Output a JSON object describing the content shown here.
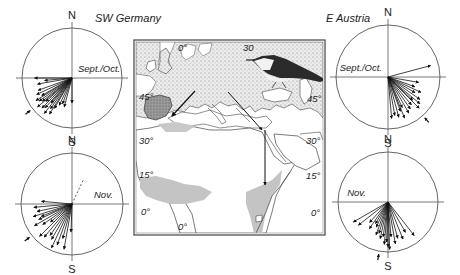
{
  "figure": {
    "regions": {
      "left": "SW Germany",
      "right": "E Austria"
    },
    "compass": {
      "north": "N",
      "south": "S"
    },
    "panels": [
      {
        "id": "sw-germany-septoct",
        "region": "SW Germany",
        "period": "Sept./Oct.",
        "cx": 72,
        "cy": 78,
        "r": 50,
        "mean_direction_deg": 232,
        "vectors_deg": [
          270,
          265,
          260,
          250,
          245,
          240,
          238,
          235,
          232,
          230,
          228,
          225,
          222,
          220,
          218,
          215,
          212,
          210,
          205,
          200,
          195,
          180
        ],
        "vectors_len": [
          0.75,
          0.55,
          0.7,
          0.72,
          0.78,
          0.7,
          0.85,
          0.8,
          0.75,
          0.9,
          0.7,
          0.85,
          0.8,
          0.65,
          0.9,
          0.75,
          0.85,
          0.7,
          0.6,
          0.55,
          0.6,
          0.5
        ]
      },
      {
        "id": "sw-germany-nov",
        "region": "SW Germany",
        "period": "Nov.",
        "cx": 72,
        "cy": 204,
        "r": 51,
        "mean_direction_deg": 232,
        "outlier_deg": 25,
        "vectors_deg": [
          275,
          265,
          258,
          252,
          248,
          245,
          240,
          235,
          230,
          225,
          220,
          215,
          210,
          205,
          200,
          195,
          190,
          182
        ],
        "vectors_len": [
          0.6,
          0.75,
          0.7,
          0.8,
          0.65,
          0.72,
          0.85,
          0.7,
          0.55,
          0.9,
          0.85,
          0.75,
          0.8,
          0.95,
          0.85,
          0.7,
          0.9,
          0.55
        ]
      },
      {
        "id": "e-austria-septoct",
        "region": "E Austria",
        "period": "Sept./Oct.",
        "cx": 388,
        "cy": 77,
        "r": 52,
        "mean_direction_deg": 138,
        "vectors_deg": [
          75,
          100,
          110,
          115,
          120,
          125,
          130,
          133,
          135,
          140,
          145,
          150,
          155,
          158,
          160,
          165,
          170,
          175
        ],
        "vectors_len": [
          0.85,
          0.6,
          0.55,
          0.7,
          0.6,
          0.75,
          0.8,
          0.65,
          0.85,
          0.7,
          0.75,
          0.8,
          0.65,
          0.85,
          0.7,
          0.8,
          0.75,
          0.8
        ]
      },
      {
        "id": "e-austria-nov",
        "region": "E Austria",
        "period": "Nov.",
        "cx": 388,
        "cy": 202,
        "r": 50,
        "mean_direction_deg": 190,
        "vectors_deg": [
          142,
          150,
          158,
          165,
          170,
          175,
          178,
          180,
          182,
          185,
          188,
          192,
          196,
          200,
          205,
          210,
          215,
          222,
          232,
          240
        ],
        "vectors_len": [
          0.85,
          0.7,
          0.8,
          0.75,
          0.85,
          0.7,
          0.95,
          0.9,
          0.8,
          0.85,
          0.7,
          0.75,
          0.65,
          0.7,
          0.55,
          0.5,
          0.65,
          0.55,
          0.75,
          0.8
        ]
      }
    ],
    "map": {
      "lat_labels_left": [
        "45°",
        "30°",
        "15°",
        "0°"
      ],
      "lat_labels_right": [
        "45°",
        "30°",
        "15°",
        "0°"
      ],
      "lon_labels_top": [
        "0°",
        "30"
      ],
      "lon_labels_bottom": [
        "0°"
      ],
      "routes": [
        {
          "name": "SW route",
          "from": "Central Europe",
          "to": "Iberia"
        },
        {
          "name": "SE route",
          "from": "Central Europe",
          "to": "East Africa"
        }
      ],
      "colors": {
        "breeding_stipple": "#9a9a9a",
        "wintering_fill": "#c4c4c4",
        "iberia_fill": "#8e8e8e",
        "outline": "#333333"
      }
    }
  }
}
